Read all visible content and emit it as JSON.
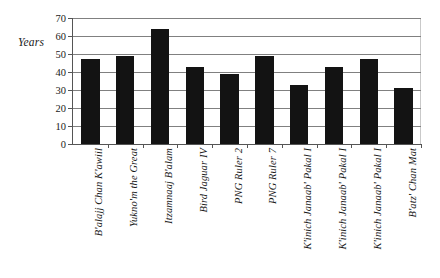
{
  "chart_data": {
    "type": "bar",
    "title": "",
    "xlabel": "",
    "ylabel": "Years",
    "ylim": [
      0,
      70
    ],
    "y_ticks": [
      0,
      10,
      20,
      30,
      40,
      50,
      60,
      70
    ],
    "grid": true,
    "legend": false,
    "bar_color": "#131313",
    "categories": [
      "B'alajj Chan K'awiil",
      "Yukno'm the Great",
      "Itzamnaaj B'alam",
      "Bird Jaguar IV",
      "PNG Ruler 2",
      "PNG Ruler 7",
      "K'inich Janaab' Pakal I",
      "K'inich Janaab' Pakal I",
      "K'inich Janaab' Pakal I",
      "B'atz' Chan Mat"
    ],
    "values": [
      47,
      49,
      64,
      43,
      39,
      49,
      33,
      43,
      47,
      31
    ]
  }
}
